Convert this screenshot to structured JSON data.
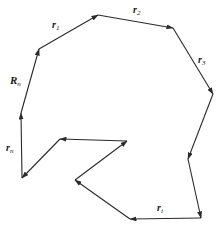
{
  "diagram": {
    "stroke_color": "#2a2a2a",
    "vectors": [
      {
        "id": "Rn",
        "x1": 21,
        "y1": 113,
        "x2": 39,
        "y2": 49
      },
      {
        "id": "r1",
        "x1": 39,
        "y1": 49,
        "x2": 98,
        "y2": 15
      },
      {
        "id": "r2",
        "x1": 98,
        "y1": 15,
        "x2": 173,
        "y2": 28
      },
      {
        "id": "r3",
        "x1": 173,
        "y1": 28,
        "x2": 213,
        "y2": 94
      },
      {
        "id": "r4",
        "x1": 213,
        "y1": 94,
        "x2": 188,
        "y2": 159
      },
      {
        "id": "r5",
        "x1": 188,
        "y1": 159,
        "x2": 201,
        "y2": 218
      },
      {
        "id": "ri",
        "x1": 201,
        "y1": 218,
        "x2": 130,
        "y2": 219
      },
      {
        "id": "r7",
        "x1": 130,
        "y1": 219,
        "x2": 75,
        "y2": 180
      },
      {
        "id": "r8",
        "x1": 75,
        "y1": 180,
        "x2": 127,
        "y2": 141
      },
      {
        "id": "r9",
        "x1": 127,
        "y1": 141,
        "x2": 60,
        "y2": 139
      },
      {
        "id": "r10",
        "x1": 60,
        "y1": 139,
        "x2": 22,
        "y2": 178
      },
      {
        "id": "rn",
        "x1": 22,
        "y1": 178,
        "x2": 21,
        "y2": 113
      }
    ],
    "labels": {
      "Rn": {
        "main": "R",
        "sub": "n"
      },
      "r1": {
        "main": "r",
        "sub": "1"
      },
      "r2": {
        "main": "r",
        "sub": "2"
      },
      "r3": {
        "main": "r",
        "sub": "3"
      },
      "rn": {
        "main": "r",
        "sub": "n"
      },
      "ri": {
        "main": "r",
        "sub": "i"
      }
    }
  }
}
